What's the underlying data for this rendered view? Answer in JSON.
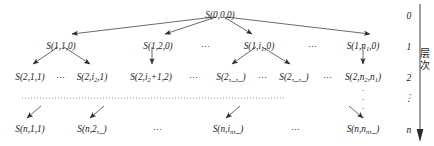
{
  "figure": {
    "type": "hierarchical-tree-diagram",
    "axis": {
      "label": "层次",
      "label_meaning": "level",
      "direction": "downward",
      "tick_labels": [
        "0",
        "1",
        "2",
        "⋮",
        "n"
      ]
    },
    "rows": [
      {
        "level": "0",
        "nodes": [
          {
            "id": "root",
            "text": "S(0,0,0)",
            "parts": [
              {
                "t": "S(0,0,0)"
              }
            ],
            "x": 220,
            "y": 10
          }
        ],
        "ellipses": []
      },
      {
        "level": "1",
        "nodes": [
          {
            "id": "n-1-1",
            "text": "S(1,1,0)",
            "parts": [
              {
                "t": "S(1,1,0)"
              }
            ],
            "x": 61,
            "y": 41
          },
          {
            "id": "n-1-2",
            "text": "S(1,2,0)",
            "parts": [
              {
                "t": "S(1,2,0)"
              }
            ],
            "x": 158,
            "y": 41
          },
          {
            "id": "n-1-i",
            "text": "S(1,i1,0)",
            "parts": [
              {
                "t": "S(1,"
              },
              {
                "t": "i",
                "sub": "1"
              },
              {
                "t": ",0)"
              }
            ],
            "x": 259,
            "y": 41
          },
          {
            "id": "n-1-n",
            "text": "S(1,n1,0)",
            "parts": [
              {
                "t": "S(1,"
              },
              {
                "t": "n",
                "sub": "1"
              },
              {
                "t": ",0)"
              }
            ],
            "x": 363,
            "y": 41
          }
        ],
        "ellipses": [
          {
            "text": "⋯",
            "x": 206,
            "y": 42
          },
          {
            "text": "⋯",
            "x": 313,
            "y": 42
          }
        ]
      },
      {
        "level": "2",
        "nodes": [
          {
            "id": "n-2-1",
            "text": "S(2,1,1)",
            "parts": [
              {
                "t": "S(2,1,1)"
              }
            ],
            "x": 30,
            "y": 72
          },
          {
            "id": "n-2-i2",
            "text": "S(2,i2,1)",
            "parts": [
              {
                "t": "S(2,"
              },
              {
                "t": "i",
                "sub": "2"
              },
              {
                "t": ",1)"
              }
            ],
            "x": 92,
            "y": 72
          },
          {
            "id": "n-2-i2p1",
            "text": "S(2,i2+1,2)",
            "parts": [
              {
                "t": "S(2,"
              },
              {
                "t": "i",
                "sub": "2"
              },
              {
                "t": "+1,2)"
              }
            ],
            "x": 151,
            "y": 72
          },
          {
            "id": "n-2-a",
            "text": "S(2,_,_)",
            "parts": [
              {
                "t": "S(2,_,_)"
              }
            ],
            "x": 231,
            "y": 72
          },
          {
            "id": "n-2-b",
            "text": "S(2,_,_)",
            "parts": [
              {
                "t": "S(2,_,_)"
              }
            ],
            "x": 294,
            "y": 72
          },
          {
            "id": "n-2-n",
            "text": "S(2,n2,n1)",
            "parts": [
              {
                "t": "S(2,"
              },
              {
                "t": "n",
                "sub": "2"
              },
              {
                "t": ","
              },
              {
                "t": "n",
                "sub": "1"
              },
              {
                "t": ")"
              }
            ],
            "x": 363,
            "y": 72
          }
        ],
        "ellipses": [
          {
            "text": "⋯",
            "x": 61,
            "y": 73
          },
          {
            "text": "⋯",
            "x": 194,
            "y": 73
          },
          {
            "text": "⋯",
            "x": 263,
            "y": 73
          },
          {
            "text": "⋯",
            "x": 328,
            "y": 73
          }
        ]
      },
      {
        "level": "n",
        "nodes": [
          {
            "id": "n-n-1",
            "text": "S(n,1,1)",
            "parts": [
              {
                "t": "S(n,1,1)"
              }
            ],
            "x": 30,
            "y": 124
          },
          {
            "id": "n-n-2",
            "text": "S(n,2,_)",
            "parts": [
              {
                "t": "S(n,2,_)"
              }
            ],
            "x": 92,
            "y": 124
          },
          {
            "id": "n-n-i",
            "text": "S(n,in,_)",
            "parts": [
              {
                "t": "S(n,"
              },
              {
                "t": "i",
                "sub": "n"
              },
              {
                "t": ",_)"
              }
            ],
            "x": 228,
            "y": 124
          },
          {
            "id": "n-n-n",
            "text": "S(n,nn,_)",
            "parts": [
              {
                "t": "S(n,"
              },
              {
                "t": "n",
                "sub": "n"
              },
              {
                "t": ",_)"
              }
            ],
            "x": 363,
            "y": 124
          }
        ],
        "ellipses": [
          {
            "text": "⋯",
            "x": 158,
            "y": 125
          },
          {
            "text": "⋯",
            "x": 296,
            "y": 125
          }
        ]
      }
    ],
    "level_markers": [
      {
        "label": "0",
        "x": 409,
        "y": 10
      },
      {
        "label": "1",
        "x": 409,
        "y": 41
      },
      {
        "label": "2",
        "x": 409,
        "y": 72
      },
      {
        "label": "⋮",
        "x": 409,
        "y": 96
      },
      {
        "label": "n",
        "x": 409,
        "y": 124
      }
    ],
    "vertical_dots": [
      {
        "x": 363,
        "y": 84,
        "count": 4
      }
    ],
    "separator": {
      "style": "dotted",
      "x1": 22,
      "x2": 285,
      "y": 98
    },
    "colors": {
      "ink": "#1a1a1a",
      "edge": "#333333",
      "background": "#ffffff"
    }
  }
}
